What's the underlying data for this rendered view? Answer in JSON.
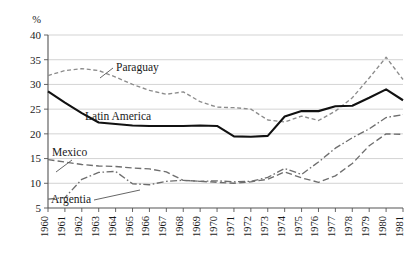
{
  "chart_data": {
    "type": "line",
    "title": "",
    "xlabel": "",
    "ylabel": "%",
    "ylim": [
      5,
      40
    ],
    "yticks": [
      5,
      10,
      15,
      20,
      25,
      30,
      35,
      40
    ],
    "grid": true,
    "legend_position": "inline-annotations",
    "x": [
      1960,
      1961,
      1962,
      1963,
      1964,
      1965,
      1966,
      1967,
      1968,
      1969,
      1970,
      1971,
      1972,
      1973,
      1974,
      1975,
      1976,
      1977,
      1978,
      1979,
      1980,
      1981
    ],
    "xtick_labels": [
      "1960",
      "1961",
      "1962",
      "1963",
      "1964",
      "1965",
      "1966",
      "1967",
      "1968",
      "1969",
      "1970",
      "1971",
      "1972",
      "1973",
      "1974",
      "1975",
      "1976",
      "1977",
      "1978",
      "1979",
      "1980",
      "1981"
    ],
    "series": [
      {
        "name": "Paraguay",
        "style": "dashed",
        "color": "#8c8c8c",
        "values": [
          31.8,
          32.8,
          33.2,
          32.8,
          31.5,
          30.0,
          28.8,
          28.0,
          28.5,
          26.5,
          25.4,
          25.3,
          25.0,
          22.8,
          22.4,
          23.6,
          22.7,
          24.6,
          27.3,
          31.3,
          35.5,
          31.0
        ]
      },
      {
        "name": "Latin America",
        "style": "solid",
        "color": "#111111",
        "values": [
          28.6,
          26.3,
          24.2,
          22.3,
          22.0,
          21.7,
          21.6,
          21.6,
          21.6,
          21.7,
          21.6,
          19.5,
          19.4,
          19.6,
          23.5,
          24.6,
          24.6,
          25.6,
          25.7,
          27.3,
          29.0,
          26.8
        ]
      },
      {
        "name": "Mexico",
        "style": "long-dashed",
        "color": "#6e6e6e",
        "values": [
          14.8,
          14.3,
          13.8,
          13.5,
          13.4,
          13.1,
          12.9,
          12.3,
          10.6,
          10.4,
          10.2,
          10.0,
          10.3,
          10.8,
          12.3,
          11.1,
          10.2,
          11.5,
          14.0,
          17.6,
          20.0,
          19.9
        ]
      },
      {
        "name": "Argentia",
        "style": "dash-dot",
        "color": "#6e6e6e",
        "values": [
          6.8,
          7.1,
          10.8,
          12.2,
          12.4,
          9.9,
          9.7,
          10.4,
          10.6,
          10.4,
          10.5,
          10.3,
          10.4,
          11.2,
          13.0,
          11.8,
          14.3,
          17.1,
          19.2,
          21.0,
          23.3,
          23.9
        ]
      }
    ],
    "annotations": [
      {
        "name": "Paraguay",
        "label_x": 116,
        "label_y": 71,
        "leader": true
      },
      {
        "name": "Latin America",
        "label_x": 85,
        "label_y": 120,
        "leader": false
      },
      {
        "name": "Mexico",
        "label_x": 52,
        "label_y": 156,
        "leader": true
      },
      {
        "name": "Argentia",
        "label_x": 51,
        "label_y": 203,
        "leader": true
      }
    ]
  },
  "colors": {
    "grid": "#c8c8c8",
    "axis": "#555555",
    "solid_series": "#111111",
    "dashed_series": "#8c8c8c",
    "text": "#1a1a1a",
    "background": "#ffffff"
  }
}
